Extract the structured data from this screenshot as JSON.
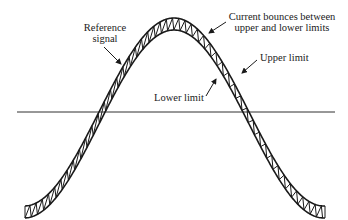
{
  "diagram": {
    "type": "hysteresis-current-control-waveform",
    "colors": {
      "ink": "#1a1a1a",
      "background": "#ffffff"
    },
    "labels": {
      "reference_signal": {
        "line1": "Reference",
        "line2": "signal"
      },
      "current_bounces": {
        "line1": "Current bounces between",
        "line2": "upper and lower limits"
      },
      "upper_limit": "Upper limit",
      "lower_limit": "Lower limit"
    },
    "elements": {
      "upper_limit_curve": "outer sinusoidal boundary",
      "lower_limit_curve": "inner sinusoidal boundary",
      "current_zigzag": "triangular ripple between limits",
      "zero_axis": "horizontal reference line"
    }
  }
}
